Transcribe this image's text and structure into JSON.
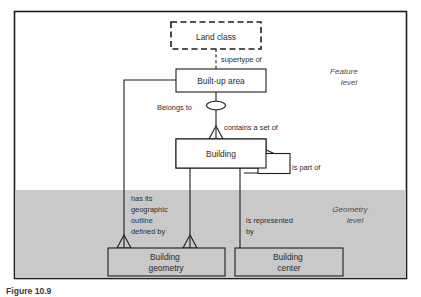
{
  "figure": {
    "caption": "Figure 10.9",
    "frame": {
      "border_color": "#1d1d1d",
      "background": "#ffffff"
    }
  },
  "levels": [
    {
      "id": "feature-level",
      "label_line1": "Feature",
      "label_line2": "level",
      "background": "#ffffff"
    },
    {
      "id": "geometry-level",
      "label_line1": "Geometry",
      "label_line2": "level",
      "background": "#c9c9c9"
    }
  ],
  "nodes": [
    {
      "id": "land-class",
      "label_line1": "Land class",
      "label_line2": "",
      "style": "dashed",
      "fill": "#ffffff"
    },
    {
      "id": "builtup-area",
      "label_line1": "Built-up area",
      "label_line2": "",
      "style": "solid",
      "fill": "#ffffff"
    },
    {
      "id": "building",
      "label_line1": "Building",
      "label_line2": "",
      "style": "solid",
      "fill": "#ffffff"
    },
    {
      "id": "building-loop",
      "label_line1": "",
      "label_line2": "",
      "style": "solid",
      "fill": "#ffffff"
    },
    {
      "id": "building-geometry",
      "label_line1": "Building",
      "label_line2": "geometry",
      "style": "solid",
      "fill": "#c9c9c9"
    },
    {
      "id": "building-center",
      "label_line1": "Building",
      "label_line2": "center",
      "style": "solid",
      "fill": "#c9c9c9"
    }
  ],
  "edges": [
    {
      "id": "supertype-of",
      "from": "land-class",
      "to": "builtup-area",
      "label_line1": "supertype of",
      "label_line2": "",
      "label_line3": "",
      "label_line4": "",
      "line_style": "dashed"
    },
    {
      "id": "belongs-to",
      "from": "builtup-area",
      "to": "building",
      "label_line1": "Belongs to",
      "label_line2": "",
      "label_line3": "",
      "label_line4": "",
      "line_style": "solid"
    },
    {
      "id": "contains-a-set-of",
      "from": "builtup-area",
      "to": "building",
      "label_line1": "contains a set of",
      "label_line2": "",
      "label_line3": "",
      "label_line4": "",
      "line_style": "solid"
    },
    {
      "id": "is-part-of",
      "from": "building",
      "to": "building",
      "label_line1": "is part of",
      "label_line2": "",
      "label_line3": "",
      "label_line4": "",
      "line_style": "solid"
    },
    {
      "id": "has-outline-defined-by",
      "from": "builtup-area",
      "to": "building-geometry",
      "label_line1": "has its",
      "label_line2": "geographic",
      "label_line3": "outline",
      "label_line4": "defined by",
      "line_style": "solid"
    },
    {
      "id": "is-represented-by",
      "from": "building",
      "to": "building-center",
      "label_line1": "is represented",
      "label_line2": "by",
      "label_line3": "",
      "label_line4": "",
      "line_style": "solid"
    }
  ]
}
